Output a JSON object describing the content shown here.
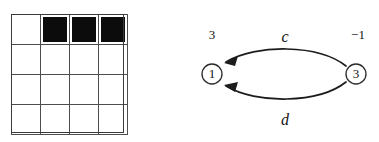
{
  "figure": {
    "background_color": "#ffffff",
    "width": 379,
    "height": 142
  },
  "grid": {
    "rows": 4,
    "cols": 4,
    "line_color": "#4d4d4d",
    "fill_color": "#0c0c0c",
    "empty_color": "#ffffff",
    "cells": [
      [
        "empty",
        "filled",
        "filled",
        "filled"
      ],
      [
        "empty",
        "empty",
        "empty",
        "empty"
      ],
      [
        "empty",
        "empty",
        "empty",
        "empty"
      ],
      [
        "empty",
        "empty",
        "empty",
        "empty"
      ]
    ]
  },
  "graph": {
    "stroke_color": "#1c1c1c",
    "node_fill": "#ffffff",
    "nodes": [
      {
        "id": "node-1",
        "label": "1",
        "weight": "3",
        "cx": 22,
        "cy": 74,
        "r": 10
      },
      {
        "id": "node-3",
        "label": "3",
        "weight": "−1",
        "cx": 166,
        "cy": 74,
        "r": 10
      }
    ],
    "edges": [
      {
        "id": "edge-c",
        "label": "c",
        "from": "3",
        "to": "1",
        "position": "upper"
      },
      {
        "id": "edge-d",
        "label": "d",
        "from": "3",
        "to": "1",
        "position": "lower"
      }
    ]
  }
}
